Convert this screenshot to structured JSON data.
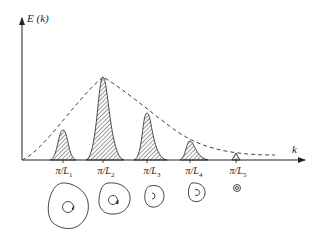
{
  "diagram": {
    "y_axis_label": "E (k)",
    "x_axis_label": "k",
    "envelope": "dashed",
    "peaks": [
      {
        "label_main": "π/L",
        "label_sub": "1",
        "x": 63,
        "height": 30
      },
      {
        "label_main": "π/L",
        "label_sub": "2",
        "x": 103,
        "height": 83
      },
      {
        "label_main": "π/L",
        "label_sub": "3",
        "x": 147,
        "height": 47
      },
      {
        "label_main": "π/L",
        "label_sub": "4",
        "x": 190,
        "height": 20
      },
      {
        "label_main": "π/L",
        "label_sub": "5",
        "x": 236,
        "height": 7
      }
    ],
    "eddies": [
      "large eddy",
      "medium-large eddy",
      "medium eddy",
      "small eddy",
      "smallest eddy"
    ]
  }
}
